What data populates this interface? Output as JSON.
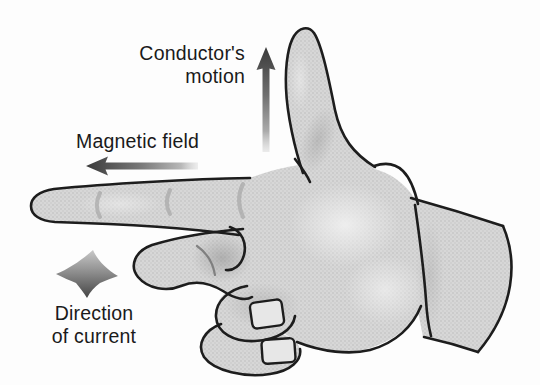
{
  "labels": {
    "conductors_motion": {
      "line1": "Conductor's",
      "line2": "motion"
    },
    "magnetic_field": "Magnetic field",
    "direction_of_current": {
      "line1": "Direction",
      "line2": "of current"
    }
  },
  "icons": {
    "motion_arrow": "arrow-up",
    "field_arrow": "arrow-left",
    "current_arrow": "arrow-down",
    "illustration": "right-hand"
  },
  "colors": {
    "background": "#fdfdfd",
    "hand_fill": "#d6d6d6",
    "hand_dot": "#c6c6c6",
    "outline": "#1d1d1d",
    "nail_fill": "#e7e7e7",
    "arrow_dark": "#3b3b3b",
    "arrow_light": "#d6d6d6",
    "text": "#1a1a1a"
  }
}
